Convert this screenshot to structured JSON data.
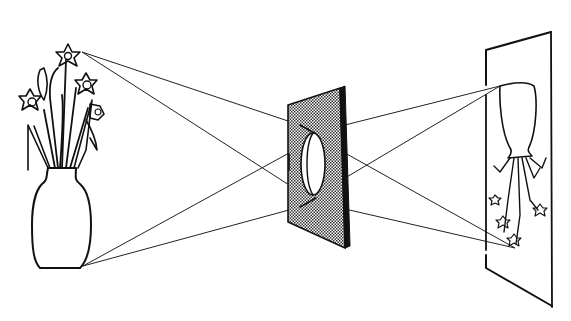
{
  "figure": {
    "title": "Convex lens forming an inverted real image",
    "elements": {
      "object": "vase-with-daffodils",
      "lens": "convex-lens-in-shaded-board",
      "screen": "projection-screen",
      "image": "inverted-vase-image"
    },
    "colors": {
      "ink": "#111111",
      "background": "#ffffff",
      "board_fill": "#bdbdbd"
    }
  }
}
